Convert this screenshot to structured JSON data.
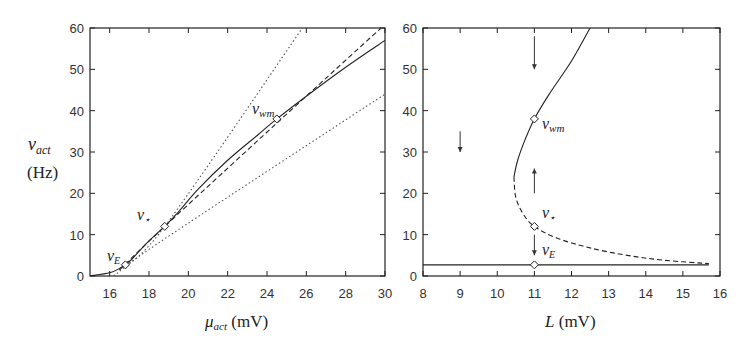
{
  "chart_data": [
    {
      "type": "line",
      "panel": "left",
      "xlabel": "μ_act (mV)",
      "ylabel": "ν_act (Hz)",
      "xlim": [
        15,
        30
      ],
      "ylim": [
        0,
        60
      ],
      "xticks": [
        16,
        18,
        20,
        22,
        24,
        26,
        28,
        30
      ],
      "yticks": [
        0,
        10,
        20,
        30,
        40,
        50,
        60
      ],
      "grid": false,
      "series": [
        {
          "name": "solid transfer function",
          "style": "solid",
          "x": [
            15,
            16,
            16.5,
            17,
            17.5,
            18,
            18.8,
            19.5,
            20.5,
            22,
            23.5,
            24.5,
            26,
            28,
            30
          ],
          "y": [
            0,
            0.8,
            1.8,
            3.5,
            6,
            8.5,
            12,
            15.5,
            21,
            28,
            34,
            38,
            43.5,
            50.5,
            57
          ]
        },
        {
          "name": "dashed line",
          "style": "dashed",
          "x": [
            16.5,
            18.8,
            24.5,
            29.8
          ],
          "y": [
            1.5,
            12,
            37,
            60
          ]
        },
        {
          "name": "dotted steep line",
          "style": "dotted",
          "x": [
            16.5,
            18.8,
            25.8
          ],
          "y": [
            1.5,
            12,
            60
          ]
        },
        {
          "name": "dotted shallow line",
          "style": "dotted",
          "x": [
            16.2,
            18.8,
            30
          ],
          "y": [
            0,
            9,
            44
          ]
        }
      ],
      "markers": [
        {
          "label": "ν_E",
          "x": 16.8,
          "y": 2.7
        },
        {
          "label": "ν_⋆",
          "x": 18.8,
          "y": 12
        },
        {
          "label": "ν_wm",
          "x": 24.5,
          "y": 38
        }
      ]
    },
    {
      "type": "line",
      "panel": "right",
      "xlabel": "L (mV)",
      "ylabel": "",
      "xlim": [
        8,
        16
      ],
      "ylim": [
        0,
        60
      ],
      "xticks": [
        8,
        9,
        10,
        11,
        12,
        13,
        14,
        15,
        16
      ],
      "yticks": [
        0,
        10,
        20,
        30,
        40,
        50,
        60
      ],
      "grid": false,
      "series": [
        {
          "name": "stable upper branch",
          "style": "solid",
          "x": [
            10.45,
            10.55,
            10.75,
            11.0,
            11.4,
            12.0,
            12.5
          ],
          "y": [
            24,
            28,
            33,
            38,
            44,
            52,
            60
          ]
        },
        {
          "name": "unstable middle branch",
          "style": "dashed",
          "x": [
            10.45,
            10.5,
            10.7,
            11.0,
            11.6,
            12.5,
            13.5,
            14.5,
            15.7
          ],
          "y": [
            24,
            19,
            15,
            12,
            9.2,
            6.8,
            5,
            3.8,
            3
          ]
        },
        {
          "name": "stable low branch",
          "style": "solid",
          "x": [
            8,
            15.7
          ],
          "y": [
            2.7,
            2.7
          ]
        }
      ],
      "markers": [
        {
          "label": "ν_wm",
          "x": 11,
          "y": 38
        },
        {
          "label": "ν_⋆",
          "x": 11,
          "y": 12
        },
        {
          "label": "ν_E",
          "x": 11,
          "y": 2.7
        }
      ],
      "arrows": [
        {
          "x": 11,
          "y_from": 58,
          "y_to": 50,
          "direction": "down"
        },
        {
          "x": 9,
          "y_from": 35,
          "y_to": 30,
          "direction": "down"
        },
        {
          "x": 11,
          "y_from": 20,
          "y_to": 26,
          "direction": "up"
        },
        {
          "x": 11,
          "y_from": 10,
          "y_to": 5,
          "direction": "down"
        }
      ]
    }
  ],
  "labels": {
    "left_ylabel_sym": "ν",
    "left_ylabel_sub": "act",
    "left_ylabel_unit": "(Hz)",
    "left_xlabel_sym": "μ",
    "left_xlabel_sub": "act",
    "left_xlabel_unit": " (mV)",
    "right_xlabel_sym": "L",
    "right_xlabel_unit": " (mV)",
    "nu": "ν",
    "sub_E": "E",
    "sub_star": "⋆",
    "sub_wm": "wm"
  }
}
